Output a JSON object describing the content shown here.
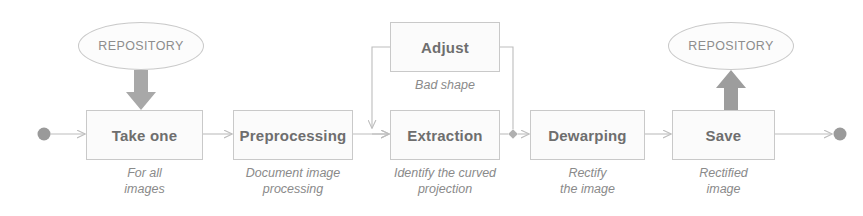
{
  "diagram": {
    "colors": {
      "box_fill": "#fbfbfb",
      "box_border": "#c9c9c9",
      "label_text": "#6e6e6e",
      "caption_text": "#8a8a8a",
      "connector": "#bdbdbd",
      "block_arrow": "#a8a8a8",
      "terminal_node": "#9a9a9a",
      "background": "#ffffff"
    },
    "start_node": {
      "name": "start-node",
      "shape": "filled-circle"
    },
    "end_node": {
      "name": "end-node",
      "shape": "filled-circle"
    },
    "junction": {
      "name": "decision-junction",
      "shape": "small-diamond"
    },
    "repositories": [
      {
        "id": "repository-source",
        "label": "REPOSITORY"
      },
      {
        "id": "repository-target",
        "label": "REPOSITORY"
      }
    ],
    "steps": [
      {
        "id": "take-one",
        "label": "Take one",
        "caption": "For all\nimages"
      },
      {
        "id": "preprocessing",
        "label": "Preprocessing",
        "caption": "Document image\nprocessing"
      },
      {
        "id": "extraction",
        "label": "Extraction",
        "caption": "Identify the curved\nprojection"
      },
      {
        "id": "dewarping",
        "label": "Dewarping",
        "caption": "Rectify\nthe image"
      },
      {
        "id": "save",
        "label": "Save",
        "caption": "Rectified\nimage"
      }
    ],
    "branch_step": {
      "id": "adjust",
      "label": "Adjust",
      "caption": "Bad shape"
    }
  }
}
